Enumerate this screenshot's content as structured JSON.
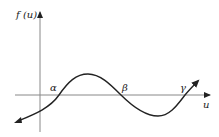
{
  "diagram": {
    "title": "",
    "y_axis_label": "f (u)",
    "x_axis_label": "u",
    "roots": [
      {
        "symbol": "α",
        "name": "alpha"
      },
      {
        "symbol": "β",
        "name": "beta"
      },
      {
        "symbol": "γ",
        "name": "gamma"
      }
    ],
    "curve_description": "Cubic-like curve rising from lower-left, crossing u-axis at α, reaching a maximum, crossing at β, reaching a minimum, crossing at γ and rising to the upper right",
    "colors": {
      "axis": "#888888",
      "curve": "#222222",
      "text": "#222222"
    }
  }
}
